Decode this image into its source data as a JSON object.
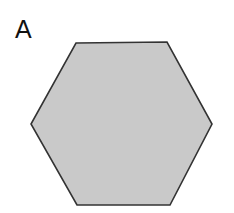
{
  "panel": {
    "label": "A"
  },
  "shape": {
    "type": "hexagon",
    "points": "76,43 167,42 212,124 170,205 77,205 31,124",
    "fill": "#c9c9c9",
    "stroke": "#333333",
    "stroke_width": 1.6
  }
}
